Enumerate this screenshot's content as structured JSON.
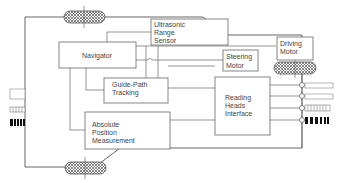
{
  "diagram": {
    "colors": {
      "line": "#555555",
      "box": "#666666",
      "text": "#444444",
      "background": "#ffffff"
    },
    "blocks": {
      "ultrasonic": {
        "lines": [
          "Ultrasonic",
          "Range",
          "Sensor"
        ]
      },
      "navigator": {
        "lines": [
          "Navigator"
        ]
      },
      "steering": {
        "lines": [
          "Steering",
          "Motor"
        ]
      },
      "driving": {
        "lines": [
          "Driving",
          "Motor"
        ]
      },
      "guide_path": {
        "lines": [
          "Guide-Path",
          "Tracking"
        ]
      },
      "reading_heads": {
        "lines": [
          "Reading",
          "Heads",
          "Interface"
        ]
      },
      "absolute_position": {
        "lines": [
          "Absolute",
          "Position",
          "Measurement"
        ]
      }
    },
    "components": [
      {
        "name": "wheel-top",
        "type": "hatched-wheel"
      },
      {
        "name": "wheel-bottom",
        "type": "hatched-wheel"
      },
      {
        "name": "wheel-drive",
        "type": "hatched-wheel"
      },
      {
        "name": "reading-heads-sensors",
        "count": 4,
        "type": "circle-connectors"
      },
      {
        "name": "guide-path-markers",
        "type": "striped-track"
      }
    ]
  }
}
